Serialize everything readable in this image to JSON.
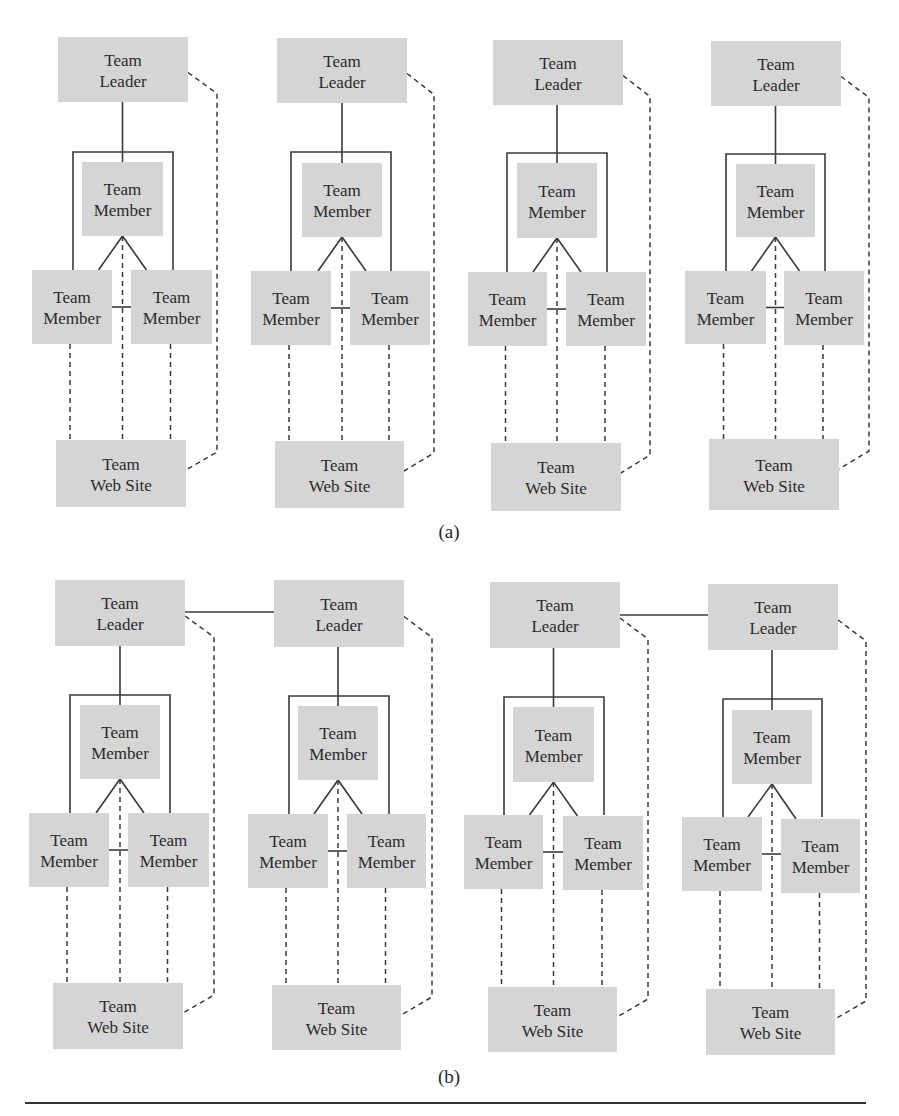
{
  "colors": {
    "box_fill": "#d5d5d5",
    "line": "#3a3a3a",
    "text": "#2a2a2a"
  },
  "labels": {
    "leader": [
      "Team",
      "Leader"
    ],
    "member": [
      "Team",
      "Member"
    ],
    "website": [
      "Team",
      "Web Site"
    ]
  },
  "panels": [
    {
      "caption": "(a)",
      "caption_pos": [
        449,
        538
      ],
      "leader_links": [],
      "groups": [
        {
          "leader": [
            58,
            37,
            130,
            65
          ],
          "frame": [
            73,
            152,
            173,
            270
          ],
          "middle": [
            82,
            162,
            81,
            74
          ],
          "left": [
            32,
            270,
            80,
            74
          ],
          "right": [
            131,
            270,
            81,
            74
          ],
          "website": [
            56,
            440,
            130,
            67
          ],
          "dash_x": 217
        },
        {
          "leader": [
            277,
            38,
            130,
            65
          ],
          "frame": [
            291,
            152,
            391,
            271
          ],
          "middle": [
            302,
            163,
            80,
            74
          ],
          "left": [
            251,
            271,
            80,
            74
          ],
          "right": [
            350,
            271,
            80,
            74
          ],
          "website": [
            275,
            441,
            129,
            67
          ],
          "dash_x": 434
        },
        {
          "leader": [
            493,
            40,
            130,
            65
          ],
          "frame": [
            507,
            153,
            607,
            272
          ],
          "middle": [
            517,
            163,
            80,
            75
          ],
          "left": [
            468,
            272,
            79,
            74
          ],
          "right": [
            566,
            272,
            80,
            74
          ],
          "website": [
            491,
            443,
            130,
            68
          ],
          "dash_x": 650
        },
        {
          "leader": [
            711,
            41,
            130,
            65
          ],
          "frame": [
            726,
            154,
            825,
            271
          ],
          "middle": [
            736,
            164,
            79,
            73
          ],
          "left": [
            685,
            271,
            81,
            73
          ],
          "right": [
            784,
            271,
            80,
            74
          ],
          "website": [
            709,
            439,
            130,
            71
          ],
          "dash_x": 869
        }
      ]
    },
    {
      "caption": "(b)",
      "caption_pos": [
        449,
        1083
      ],
      "leader_links": [
        [
          0,
          1,
          612
        ],
        [
          2,
          3,
          615
        ]
      ],
      "groups": [
        {
          "leader": [
            55,
            580,
            130,
            66
          ],
          "frame": [
            70,
            695,
            170,
            813
          ],
          "middle": [
            80,
            705,
            80,
            74
          ],
          "left": [
            29,
            813,
            80,
            74
          ],
          "right": [
            128,
            813,
            81,
            74
          ],
          "website": [
            53,
            983,
            130,
            66
          ],
          "dash_x": 214
        },
        {
          "leader": [
            274,
            580,
            130,
            67
          ],
          "frame": [
            289,
            696,
            389,
            814
          ],
          "middle": [
            298,
            706,
            80,
            74
          ],
          "left": [
            248,
            814,
            80,
            74
          ],
          "right": [
            347,
            814,
            79,
            74
          ],
          "website": [
            272,
            985,
            129,
            65
          ],
          "dash_x": 432
        },
        {
          "leader": [
            490,
            582,
            130,
            66
          ],
          "frame": [
            504,
            697,
            604,
            815
          ],
          "middle": [
            513,
            707,
            81,
            75
          ],
          "left": [
            464,
            815,
            79,
            74
          ],
          "right": [
            563,
            816,
            80,
            74
          ],
          "website": [
            488,
            987,
            129,
            65
          ],
          "dash_x": 648
        },
        {
          "leader": [
            708,
            584,
            130,
            66
          ],
          "frame": [
            723,
            699,
            822,
            817
          ],
          "middle": [
            732,
            710,
            80,
            74
          ],
          "left": [
            682,
            817,
            80,
            74
          ],
          "right": [
            781,
            819,
            79,
            74
          ],
          "website": [
            706,
            989,
            129,
            66
          ],
          "dash_x": 866
        }
      ]
    }
  ],
  "rule": {
    "x1": 25,
    "x2": 866,
    "y": 1103
  }
}
